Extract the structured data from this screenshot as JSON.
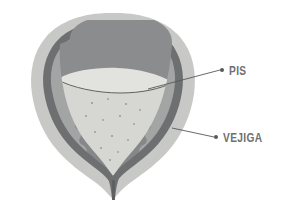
{
  "figure": {
    "background_color": "#ffffff",
    "width": 282,
    "height": 203
  },
  "labels": [
    {
      "id": "pis",
      "text": "PIS",
      "meaning": "urine",
      "color": "#6f6f6f",
      "leader_dot_color": "#58585a",
      "leader_line_color": "#58585a",
      "dot": {
        "x": 222,
        "y": 70
      },
      "anchor": {
        "x": 148,
        "y": 89
      }
    },
    {
      "id": "vejiga",
      "text": "VEJIGA",
      "meaning": "bladder",
      "color": "#6f6f6f",
      "leader_dot_color": "#58585a",
      "leader_line_color": "#58585a",
      "dot": {
        "x": 216,
        "y": 137
      },
      "anchor": {
        "x": 172,
        "y": 128
      }
    }
  ],
  "anatomy": {
    "outer_wall": {
      "name": "serosa-outer-wall",
      "color": "#c8c8c6",
      "edge_color": "#bdbdbb"
    },
    "muscle_layer": {
      "name": "detrusor-muscle-layer",
      "color": "#6e6f71"
    },
    "mucosa_layer": {
      "name": "mucosa-inner-lining",
      "color": "#a3a4a4"
    },
    "air_space": {
      "name": "upper-cavity-space",
      "color": "#8b8c8e"
    },
    "urine": {
      "name": "urine-fluid",
      "color": "#d6d7d3",
      "surface_line_color": "#5f6061",
      "speckle_color": "#9a9a98",
      "speckle_count": 14
    },
    "urethra": {
      "name": "urethra-neck",
      "color": "#6e6f71"
    }
  },
  "colors": {
    "background": "#ffffff",
    "outer_wall": "#c8c8c6",
    "muscle": "#6e6f71",
    "mucosa": "#a3a4a4",
    "air": "#8b8c8e",
    "urine": "#d6d7d3",
    "label": "#6f6f6f",
    "leader": "#58585a"
  }
}
